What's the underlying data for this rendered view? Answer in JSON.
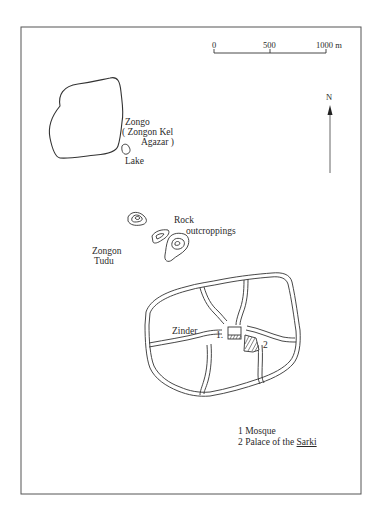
{
  "scale_bar": {
    "ticks": [
      "0",
      "500",
      "1000 m"
    ]
  },
  "north_arrow": {
    "label": "N"
  },
  "places": {
    "zongo": {
      "name": "Zongo",
      "line2": "( Zongon Kel",
      "line3": "Agazar )"
    },
    "lake": {
      "name": "Lake"
    },
    "rock": {
      "line1": "Rock",
      "line2": "outcroppings"
    },
    "zongon_tudu": {
      "line1": "Zongon",
      "line2": "Tudu"
    },
    "zinder": {
      "name": "Zinder"
    },
    "marker_1": "1.",
    "marker_2": "2"
  },
  "legend": {
    "item1": "1 Mosque",
    "item2_prefix": "2 Palace of the ",
    "item2_emph": "Sarki"
  },
  "colors": {
    "line": "#3a3a3a",
    "paper": "#ffffff"
  }
}
